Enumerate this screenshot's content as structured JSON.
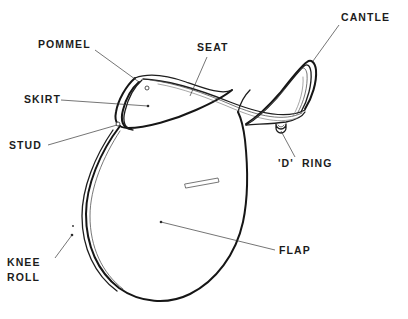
{
  "diagram": {
    "view": "side-profile",
    "background_color": "#ffffff",
    "line_color": "#161616",
    "text_color": "#1c1c1c",
    "leader_color": "#3a3a3a"
  },
  "labels": [
    {
      "id": "pommel",
      "text": "POMMEL",
      "x": 38,
      "y": 48,
      "anchor": "start",
      "leader_from": [
        95,
        50
      ],
      "leader_to": [
        139,
        82
      ]
    },
    {
      "id": "seat",
      "text": "SEAT",
      "x": 197,
      "y": 51,
      "anchor": "start",
      "leader_from": [
        207,
        57
      ],
      "leader_to": [
        190,
        96
      ]
    },
    {
      "id": "cantle",
      "text": "CANTLE",
      "x": 341,
      "y": 21,
      "anchor": "start",
      "leader_from": [
        339,
        25
      ],
      "leader_to": [
        313,
        61
      ]
    },
    {
      "id": "skirt",
      "text": "SKIRT",
      "x": 24,
      "y": 103,
      "anchor": "start",
      "leader_from": [
        61,
        100
      ],
      "leader_to": [
        148,
        106
      ]
    },
    {
      "id": "stud",
      "text": "STUD",
      "x": 9,
      "y": 149,
      "anchor": "start",
      "leader_from": [
        48,
        145
      ],
      "leader_to": [
        117,
        125
      ]
    },
    {
      "id": "d-ring",
      "text": "'D'  RING",
      "x": 278,
      "y": 167,
      "anchor": "start",
      "leader_from": [
        295,
        157
      ],
      "leader_to": [
        281,
        131
      ]
    },
    {
      "id": "flap",
      "text": "FLAP",
      "x": 279,
      "y": 254,
      "anchor": "start",
      "leader_from": [
        275,
        250
      ],
      "leader_to": [
        161,
        222
      ]
    },
    {
      "id": "knee-roll",
      "text": "KNEE",
      "text_line2": "ROLL",
      "x": 7,
      "y": 266,
      "y2": 281,
      "anchor": "start",
      "leader_from": [
        55,
        258
      ],
      "leader_to": [
        72,
        235
      ]
    }
  ],
  "parts": [
    {
      "id": "pommel",
      "name": "Pommel"
    },
    {
      "id": "seat",
      "name": "Seat"
    },
    {
      "id": "cantle",
      "name": "Cantle"
    },
    {
      "id": "skirt",
      "name": "Skirt"
    },
    {
      "id": "stud",
      "name": "Stud"
    },
    {
      "id": "d-ring",
      "name": "'D' Ring"
    },
    {
      "id": "flap",
      "name": "Flap"
    },
    {
      "id": "knee-roll",
      "name": "Knee Roll"
    }
  ],
  "details": {
    "stud_upper": {
      "cx": 147,
      "cy": 88,
      "r": 2.0
    },
    "stud_lower": {
      "cx": 118,
      "cy": 124,
      "r": 2.0
    },
    "d_ring": {
      "cx": 281,
      "cy": 128,
      "r": 4.2
    },
    "billet_strap": {
      "x": 185,
      "y": 180,
      "w": 34,
      "h": 5
    }
  }
}
